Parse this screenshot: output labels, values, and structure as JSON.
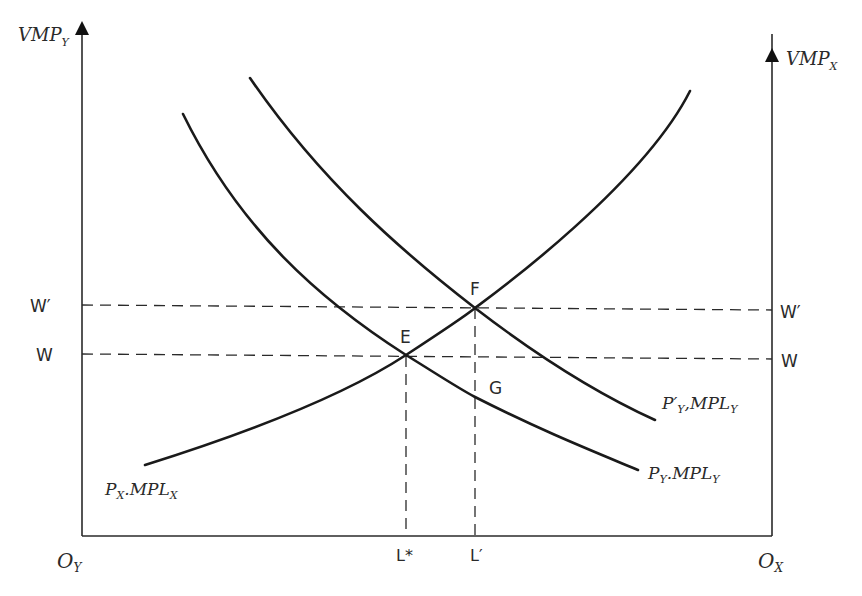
{
  "diagram": {
    "type": "specific-factors labor market equilibrium",
    "axes": {
      "left_y_label": {
        "main": "VMP",
        "sub": "Y"
      },
      "right_y_label": {
        "main": "VMP",
        "sub": "X"
      },
      "left_origin": {
        "main": "O",
        "sub": "Y"
      },
      "right_origin": {
        "main": "O",
        "sub": "X"
      }
    },
    "wage_levels": {
      "w_prime": "W′",
      "w": "W"
    },
    "labor_ticks": {
      "l_star": "L*",
      "l_prime": "L′"
    },
    "points": {
      "e": "E",
      "f": "F",
      "g": "G"
    },
    "curves": {
      "px_mplx": {
        "p": "P",
        "psub": "X",
        "sep": ".",
        "m": "MPL",
        "msub": "X"
      },
      "py_mply": {
        "p": "P",
        "psub": "Y",
        "sep": ".",
        "m": "MPL",
        "msub": "Y"
      },
      "py_prime_mply": {
        "p": "P′",
        "psub": "Y",
        "sep": ",",
        "m": "MPL",
        "msub": "Y"
      }
    }
  }
}
